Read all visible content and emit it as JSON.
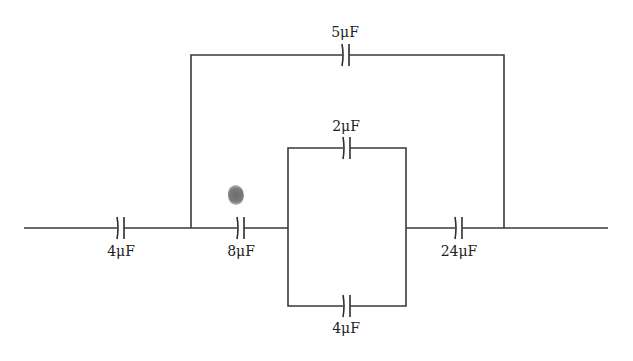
{
  "diagram": {
    "type": "capacitor-circuit",
    "capacitors": [
      {
        "id": "c1",
        "label": "4μF",
        "value_uF": 4,
        "position": "left series"
      },
      {
        "id": "c2",
        "label": "8μF",
        "value_uF": 8,
        "position": "middle series"
      },
      {
        "id": "c3",
        "label": "2μF",
        "value_uF": 2,
        "position": "inner parallel top"
      },
      {
        "id": "c4",
        "label": "4μF",
        "value_uF": 4,
        "position": "inner parallel bottom"
      },
      {
        "id": "c5",
        "label": "24μF",
        "value_uF": 24,
        "position": "right series"
      },
      {
        "id": "c6",
        "label": "5μF",
        "value_uF": 5,
        "position": "outer bypass top"
      }
    ],
    "colors": {
      "wire": "#3a3a3a",
      "background": "#ffffff",
      "blot": "#6a6a6a"
    }
  }
}
